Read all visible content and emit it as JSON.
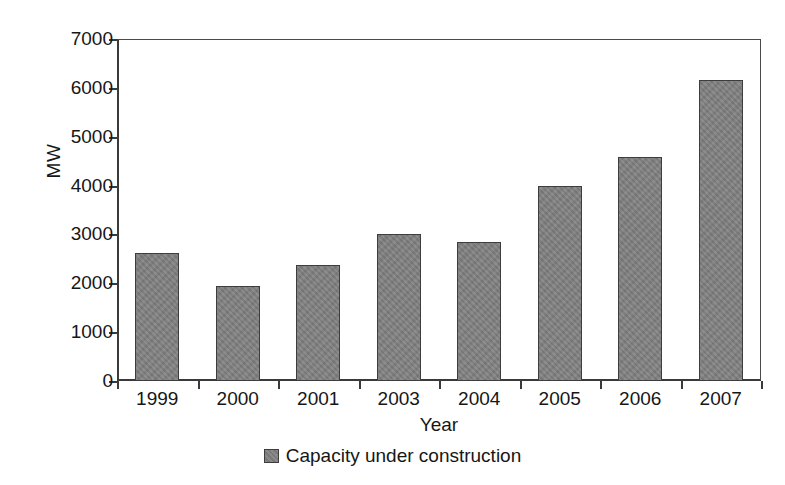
{
  "chart_data": {
    "type": "bar",
    "title": "",
    "subtitle": "",
    "xlabel": "Year",
    "ylabel": "MW",
    "categories": [
      "1999",
      "2000",
      "2001",
      "2003",
      "2004",
      "2005",
      "2006",
      "2007"
    ],
    "series": [
      {
        "name": "Capacity under construction",
        "color": "#808080",
        "values": [
          2620,
          1950,
          2380,
          3000,
          2850,
          4000,
          4580,
          6160
        ]
      }
    ],
    "ylim": [
      0,
      7000
    ],
    "yticks": [
      0,
      1000,
      2000,
      3000,
      4000,
      5000,
      6000,
      7000
    ],
    "ytick_labels": [
      "0",
      "1000",
      "2000",
      "3000",
      "4000",
      "5000",
      "6000",
      "7000"
    ],
    "grid": false,
    "legend_position": "bottom-center",
    "legend_entries": [
      "Capacity under construction"
    ],
    "annotations": [],
    "plot_background": "#ffffff",
    "axis_color": "#3a3a3a",
    "bar_edge_color": "#3d3d3d"
  }
}
